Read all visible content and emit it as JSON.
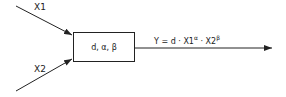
{
  "inputs": [
    {
      "label": "X1"
    },
    {
      "label": "X2"
    }
  ],
  "block": {
    "label": "d, α, β"
  },
  "output": {
    "label_prefix": "Y = d · X1",
    "exp1": "α",
    "mid": " · X2",
    "exp2": "β"
  }
}
